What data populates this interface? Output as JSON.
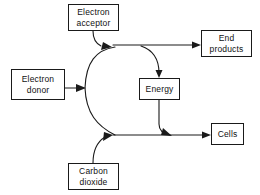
{
  "diagram": {
    "type": "flow-diagram",
    "background_color": "#ffffff",
    "stroke_color": "#1a1a1a",
    "nodes": [
      {
        "id": "electron-acceptor",
        "lines": [
          "Electron",
          "acceptor"
        ],
        "x": 68,
        "y": 4,
        "w": 51,
        "h": 27
      },
      {
        "id": "end-products",
        "lines": [
          "End",
          "products"
        ],
        "x": 201,
        "y": 30,
        "w": 51,
        "h": 27
      },
      {
        "id": "electron-donor",
        "lines": [
          "Electron",
          "donor"
        ],
        "x": 11,
        "y": 69,
        "w": 54,
        "h": 31
      },
      {
        "id": "energy",
        "lines": [
          "Energy"
        ],
        "x": 139,
        "y": 78,
        "w": 41,
        "h": 22
      },
      {
        "id": "cells",
        "lines": [
          "Cells"
        ],
        "x": 211,
        "y": 123,
        "w": 33,
        "h": 22
      },
      {
        "id": "carbon-dioxide",
        "lines": [
          "Carbon",
          "dioxide"
        ],
        "x": 68,
        "y": 163,
        "w": 51,
        "h": 27
      }
    ],
    "edges": [
      {
        "id": "acceptor-to-junction",
        "from": "electron-acceptor",
        "to": "upper-junction",
        "style": "curve",
        "arrow": true
      },
      {
        "id": "donor-to-junction",
        "from": "electron-donor",
        "to": "center-junction",
        "style": "straight",
        "arrow": true
      },
      {
        "id": "carbon-dioxide-to-junction",
        "from": "carbon-dioxide",
        "to": "lower-junction",
        "style": "curve",
        "arrow": true
      },
      {
        "id": "junction-to-end-products",
        "from": "upper-junction",
        "to": "end-products",
        "style": "straight",
        "arrow": true
      },
      {
        "id": "junction-to-energy",
        "from": "upper-branch",
        "to": "energy",
        "style": "curve",
        "arrow": true
      },
      {
        "id": "energy-to-cells",
        "from": "energy",
        "to": "lower-line",
        "style": "curve",
        "arrow": true
      },
      {
        "id": "junction-to-cells",
        "from": "lower-junction",
        "to": "cells",
        "style": "straight",
        "arrow": true
      }
    ]
  }
}
